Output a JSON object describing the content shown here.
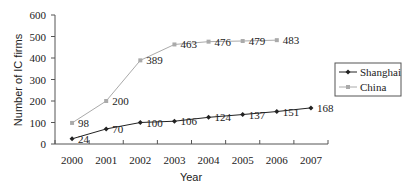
{
  "chart_data": {
    "type": "line",
    "title": "",
    "xlabel": "Year",
    "ylabel": "Number of IC firms",
    "categories": [
      "2000",
      "2001",
      "2002",
      "2003",
      "2004",
      "2005",
      "2006",
      "2007"
    ],
    "ylim": [
      0,
      600
    ],
    "yticks": [
      0,
      100,
      200,
      300,
      400,
      500,
      600
    ],
    "grid": false,
    "legend_position": "right",
    "series": [
      {
        "name": "Shanghai",
        "marker": "diamond",
        "color": "#222222",
        "values": [
          24,
          70,
          100,
          106,
          124,
          137,
          151,
          168
        ]
      },
      {
        "name": "China",
        "marker": "square",
        "color": "#aaaaaa",
        "values": [
          98,
          200,
          389,
          463,
          476,
          479,
          483,
          null
        ]
      }
    ]
  }
}
